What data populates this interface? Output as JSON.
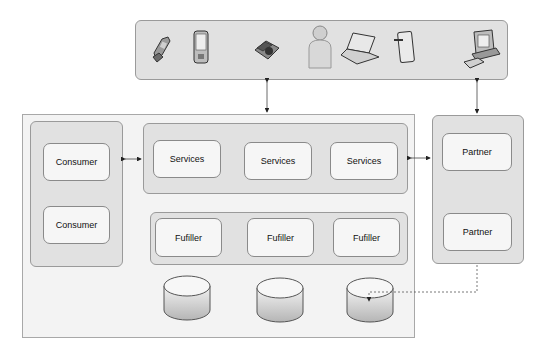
{
  "devices": [
    {
      "name": "mobile-flip-phone-icon"
    },
    {
      "name": "pda-icon"
    },
    {
      "name": "desk-telephone-icon"
    },
    {
      "name": "person-icon"
    },
    {
      "name": "laptop-icon"
    },
    {
      "name": "tablet-pen-icon"
    },
    {
      "name": "desktop-computer-icon"
    }
  ],
  "consumers": [
    {
      "label": "Consumer"
    },
    {
      "label": "Consumer"
    }
  ],
  "services": [
    {
      "label": "Services"
    },
    {
      "label": "Services"
    },
    {
      "label": "Services"
    }
  ],
  "fulfillers": [
    {
      "label": "Fufiller"
    },
    {
      "label": "Fufiller"
    },
    {
      "label": "Fufiller"
    }
  ],
  "partners": [
    {
      "label": "Partner"
    },
    {
      "label": "Partner"
    }
  ],
  "databases": [
    {
      "name": "database-1"
    },
    {
      "name": "database-2"
    },
    {
      "name": "database-3"
    }
  ],
  "colors": {
    "panel": "#e1e1e1",
    "box": "#f6f6f6",
    "outer": "#f3f3f3",
    "stroke": "#8a8a8a"
  }
}
